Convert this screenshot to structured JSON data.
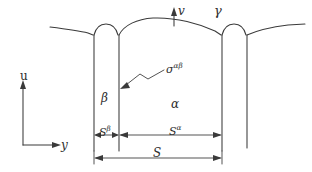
{
  "figure": {
    "background_color": "#ffffff",
    "line_color": "#3a3a3a",
    "axes": {
      "vertical_label": "u",
      "horizontal_label": "y"
    },
    "surface_normal_label": "v",
    "phases": {
      "gamma_label": "γ",
      "beta_label": "β",
      "alpha_label": "α"
    },
    "interface_tension": {
      "symbol": "σ",
      "superscript": "αβ"
    },
    "dimensions": {
      "s_beta": {
        "symbol": "S",
        "superscript": "β"
      },
      "s_alpha": {
        "symbol": "S",
        "superscript": "α"
      },
      "s_total": {
        "symbol": "S"
      }
    }
  }
}
